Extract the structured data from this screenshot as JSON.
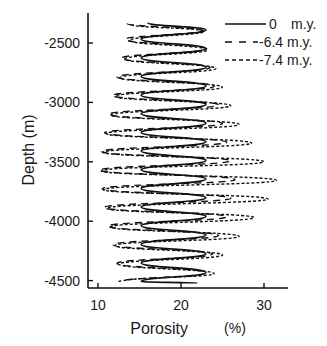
{
  "chart_data": {
    "type": "line",
    "title": "",
    "xlabel": "Porosity",
    "xunit": "(%)",
    "ylabel": "Depth (m)",
    "xlim": [
      9,
      33
    ],
    "ylim": [
      -4560,
      -2290
    ],
    "xticks": [
      10,
      20,
      30
    ],
    "yticks": [
      -2500,
      -3000,
      -3500,
      -4000,
      -4500
    ],
    "xtick_labels": [
      "10",
      "20",
      "30"
    ],
    "ytick_labels": [
      "-2500",
      "-3000",
      "-3500",
      "-4000",
      "-4500"
    ],
    "grid": false,
    "legend_position": "upper right",
    "series": [
      {
        "name": "0",
        "unit": "m.y.",
        "style": "solid",
        "color": "#111111",
        "depth_range": [
          -2330,
          -4520
        ],
        "porosity_min": 15.2,
        "porosity_max": 23.0,
        "period_m": 157,
        "first_peak_depth": -2390,
        "points": [
          [
            16.0,
            -2330
          ],
          [
            23.0,
            -2390
          ],
          [
            15.2,
            -2468
          ],
          [
            23.0,
            -2547
          ],
          [
            15.2,
            -2625
          ],
          [
            23.0,
            -2704
          ],
          [
            15.2,
            -2782
          ],
          [
            23.0,
            -2861
          ],
          [
            15.2,
            -2939
          ],
          [
            23.0,
            -3018
          ],
          [
            15.2,
            -3096
          ],
          [
            23.0,
            -3175
          ],
          [
            15.2,
            -3253
          ],
          [
            23.0,
            -3332
          ],
          [
            15.2,
            -3410
          ],
          [
            23.0,
            -3489
          ],
          [
            15.2,
            -3567
          ],
          [
            23.0,
            -3646
          ],
          [
            15.2,
            -3724
          ],
          [
            23.0,
            -3803
          ],
          [
            15.2,
            -3881
          ],
          [
            23.0,
            -3960
          ],
          [
            15.2,
            -4038
          ],
          [
            23.0,
            -4117
          ],
          [
            15.2,
            -4195
          ],
          [
            23.0,
            -4274
          ],
          [
            15.2,
            -4352
          ],
          [
            23.0,
            -4431
          ],
          [
            15.2,
            -4509
          ],
          [
            22.0,
            -4520
          ]
        ]
      },
      {
        "name": "-6.4",
        "unit": "m.y.",
        "style": "dashed",
        "color": "#111111",
        "points": [
          [
            13.5,
            -2335
          ],
          [
            22.5,
            -2395
          ],
          [
            13.3,
            -2470
          ],
          [
            23.0,
            -2550
          ],
          [
            12.8,
            -2628
          ],
          [
            23.5,
            -2707
          ],
          [
            12.3,
            -2785
          ],
          [
            24.0,
            -2864
          ],
          [
            11.8,
            -2942
          ],
          [
            24.5,
            -3021
          ],
          [
            11.3,
            -3099
          ],
          [
            25.0,
            -3178
          ],
          [
            10.8,
            -3256
          ],
          [
            25.5,
            -3335
          ],
          [
            10.4,
            -3413
          ],
          [
            26.0,
            -3492
          ],
          [
            10.2,
            -3570
          ],
          [
            26.5,
            -3649
          ],
          [
            10.5,
            -3727
          ],
          [
            26.0,
            -3806
          ],
          [
            10.8,
            -3884
          ],
          [
            25.5,
            -3963
          ],
          [
            11.2,
            -4041
          ],
          [
            24.5,
            -4120
          ],
          [
            11.8,
            -4198
          ],
          [
            23.8,
            -4277
          ],
          [
            12.3,
            -4355
          ],
          [
            23.0,
            -4434
          ],
          [
            12.5,
            -4512
          ]
        ]
      },
      {
        "name": "-7.4",
        "unit": "m.y.",
        "style": "dotted",
        "color": "#111111",
        "points": [
          [
            14.0,
            -2345
          ],
          [
            22.8,
            -2400
          ],
          [
            13.8,
            -2478
          ],
          [
            23.2,
            -2557
          ],
          [
            13.2,
            -2635
          ],
          [
            24.2,
            -2714
          ],
          [
            12.6,
            -2792
          ],
          [
            25.0,
            -2871
          ],
          [
            12.0,
            -2949
          ],
          [
            26.0,
            -3028
          ],
          [
            11.5,
            -3106
          ],
          [
            27.0,
            -3185
          ],
          [
            11.0,
            -3263
          ],
          [
            28.5,
            -3342
          ],
          [
            10.6,
            -3420
          ],
          [
            30.0,
            -3499
          ],
          [
            10.4,
            -3577
          ],
          [
            31.5,
            -3656
          ],
          [
            10.6,
            -3734
          ],
          [
            30.5,
            -3813
          ],
          [
            11.0,
            -3891
          ],
          [
            28.8,
            -3970
          ],
          [
            11.5,
            -4048
          ],
          [
            27.0,
            -4127
          ],
          [
            12.0,
            -4205
          ],
          [
            25.0,
            -4284
          ],
          [
            12.5,
            -4362
          ],
          [
            24.0,
            -4441
          ],
          [
            13.0,
            -4505
          ]
        ]
      }
    ]
  },
  "legend": {
    "items": [
      {
        "value": "0",
        "unit": "m.y."
      },
      {
        "value": "-6.4",
        "unit": "m.y."
      },
      {
        "value": "-7.4",
        "unit": "m.y."
      }
    ]
  },
  "axes": {
    "xlabel": "Porosity",
    "xunit": "(%)",
    "ylabel": "Depth (m)"
  }
}
